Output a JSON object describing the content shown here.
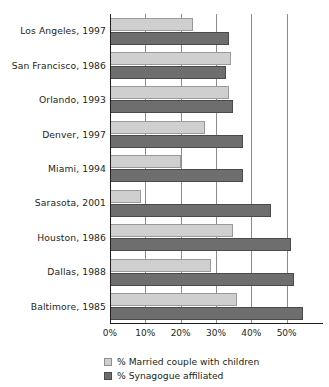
{
  "chart_data": {
    "type": "bar",
    "orientation": "horizontal",
    "title": "",
    "xlabel": "",
    "ylabel": "",
    "xlim": [
      0,
      60
    ],
    "grid": true,
    "legend_position": "bottom",
    "tick_labels": [
      "0%",
      "10%",
      "20%",
      "30%",
      "40%",
      "50%"
    ],
    "tick_values": [
      0,
      10,
      20,
      30,
      40,
      50
    ],
    "categories": [
      "Los Angeles, 1997",
      "San Francisco, 1986",
      "Orlando, 1993",
      "Denver, 1997",
      "Miami, 1994",
      "Sarasota, 2001",
      "Houston, 1986",
      "Dallas, 1988",
      "Baltimore, 1985"
    ],
    "series": [
      {
        "name": "% Married couple with children",
        "color": "#cfcfcf",
        "values": [
          23.5,
          34.3,
          33.6,
          26.8,
          20.2,
          8.9,
          34.7,
          28.6,
          36.0
        ]
      },
      {
        "name": "% Synagogue affiliated",
        "color": "#6e6e6e",
        "values": [
          33.6,
          32.9,
          34.7,
          37.7,
          37.5,
          45.5,
          51.3,
          52.1,
          54.7
        ]
      }
    ]
  }
}
